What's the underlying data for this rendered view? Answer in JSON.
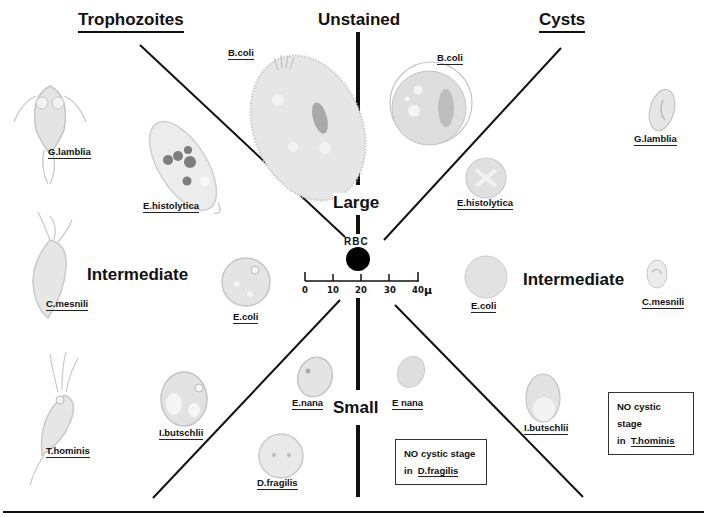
{
  "headers": {
    "left": "Trophozoites",
    "center": "Unstained",
    "right": "Cysts"
  },
  "size_sections": {
    "large": "Large",
    "intermediate_left": "Intermediate",
    "intermediate_right": "Intermediate",
    "small": "Small"
  },
  "scale": {
    "rbc_label": "RBC",
    "ticks": [
      "0",
      "10",
      "20",
      "30",
      "40"
    ],
    "unit": "μ"
  },
  "trophozoites": [
    {
      "name": "B.coli",
      "size": "Large"
    },
    {
      "name": "E.histolytica",
      "size": "Large"
    },
    {
      "name": "G.lamblia",
      "size": "Intermediate"
    },
    {
      "name": "C.mesnili",
      "size": "Intermediate"
    },
    {
      "name": "E.coli",
      "size": "Intermediate"
    },
    {
      "name": "T.hominis",
      "size": "Small"
    },
    {
      "name": "I.butschlii",
      "size": "Small"
    },
    {
      "name": "E.nana",
      "size": "Small"
    },
    {
      "name": "D.fragilis",
      "size": "Small"
    }
  ],
  "cysts": [
    {
      "name": "B.coli",
      "size": "Large"
    },
    {
      "name": "E.histolytica",
      "size": "Large"
    },
    {
      "name": "G.lamblia",
      "size": "Intermediate"
    },
    {
      "name": "E.coli",
      "size": "Intermediate"
    },
    {
      "name": "C.mesnili",
      "size": "Intermediate"
    },
    {
      "name": "E nana",
      "size": "Small"
    },
    {
      "name": "I.butschlii",
      "size": "Small"
    }
  ],
  "notes": {
    "dfragilis": {
      "line1": "NO cystic stage",
      "prefix": "in",
      "organism": "D.fragilis"
    },
    "thominis": {
      "line1": "NO cystic stage",
      "prefix": "in",
      "organism": "T.hominis"
    }
  },
  "colors": {
    "ink": "#111111",
    "cell_fill": "#e6e6e6",
    "cell_edge": "#bdbdbd",
    "inclusion_dark": "#8a8a8a",
    "rbc": "#000000"
  }
}
